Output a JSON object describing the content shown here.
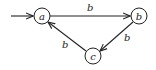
{
  "diagram": {
    "type": "state-machine",
    "nodes": [
      {
        "id": "a",
        "label": "a",
        "x": 42,
        "y": 16,
        "start": true
      },
      {
        "id": "b",
        "label": "b",
        "x": 139,
        "y": 16
      },
      {
        "id": "c",
        "label": "c",
        "x": 93,
        "y": 56
      }
    ],
    "edges": [
      {
        "from": "a",
        "to": "b",
        "label": "b"
      },
      {
        "from": "b",
        "to": "c",
        "label": "b"
      },
      {
        "from": "c",
        "to": "a",
        "label": "b"
      }
    ],
    "colors": {
      "stroke": "#222222",
      "background": "#ffffff"
    }
  }
}
